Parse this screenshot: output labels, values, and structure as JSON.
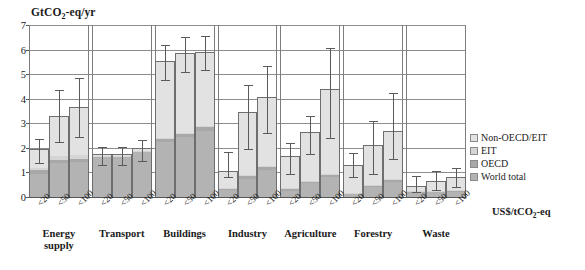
{
  "chart_data": {
    "type": "bar",
    "title": "",
    "ylabel": "GtCO2-eq/yr",
    "ylabel_html": "GtCO<sub>2</sub>-eq/yr",
    "xlabel": "US$/tCO2-eq",
    "xlabel_html": "US$/tCO<sub>2</sub>-eq",
    "ylim": [
      0,
      7
    ],
    "yticks": [
      0,
      1,
      2,
      3,
      4,
      5,
      6,
      7
    ],
    "grid": true,
    "stacked": true,
    "legend_position": "right",
    "legend": [
      {
        "name": "Non-OECD/EIT",
        "color": "#e2e2e2"
      },
      {
        "name": "EIT",
        "color": "#d5d5d5"
      },
      {
        "name": "OECD",
        "color": "#a8a8a8"
      },
      {
        "name": "World total",
        "color": "#b3b3b3"
      }
    ],
    "series": [
      {
        "name": "World total",
        "color": "#b3b3b3"
      },
      {
        "name": "OECD",
        "color": "#a8a8a8"
      },
      {
        "name": "EIT",
        "color": "#d5d5d5"
      },
      {
        "name": "Non-OECD/EIT",
        "color": "#e2e2e2"
      }
    ],
    "categories": [
      "<20",
      "<50",
      "<100"
    ],
    "groups": [
      {
        "label": "Energy supply",
        "label_lines": [
          "Energy",
          "supply"
        ],
        "bars": [
          {
            "category": "<20",
            "world_total": 0.95,
            "oecd": 0.15,
            "eit": 0.1,
            "non_oecd_eit": 0.75,
            "total": 1.95,
            "err_low": 1.4,
            "err_high": 2.35
          },
          {
            "category": "<50",
            "world_total": 1.4,
            "oecd": 0.12,
            "eit": 0.15,
            "non_oecd_eit": 1.63,
            "total": 3.3,
            "err_low": 2.25,
            "err_high": 4.35
          },
          {
            "category": "<100",
            "world_total": 1.42,
            "oecd": 0.13,
            "eit": 0.15,
            "non_oecd_eit": 1.95,
            "total": 3.65,
            "err_low": 2.45,
            "err_high": 4.85
          }
        ]
      },
      {
        "label": "Transport",
        "label_lines": [
          "Transport"
        ],
        "bars": [
          {
            "category": "<20",
            "world_total": 1.62,
            "oecd": 0.04,
            "eit": 0.02,
            "non_oecd_eit": 0.07,
            "total": 1.75,
            "err_low": 1.3,
            "err_high": 2.05
          },
          {
            "category": "<50",
            "world_total": 1.62,
            "oecd": 0.04,
            "eit": 0.02,
            "non_oecd_eit": 0.07,
            "total": 1.75,
            "err_low": 1.3,
            "err_high": 2.05
          },
          {
            "category": "<100",
            "world_total": 1.82,
            "oecd": 0.05,
            "eit": 0.02,
            "non_oecd_eit": 0.11,
            "total": 2.0,
            "err_low": 1.45,
            "err_high": 2.3
          }
        ]
      },
      {
        "label": "Buildings",
        "label_lines": [
          "Buildings"
        ],
        "bars": [
          {
            "category": "<20",
            "world_total": 2.25,
            "oecd": 0.12,
            "eit": 0.05,
            "non_oecd_eit": 3.13,
            "total": 5.55,
            "err_low": 4.75,
            "err_high": 6.2
          },
          {
            "category": "<50",
            "world_total": 2.45,
            "oecd": 0.12,
            "eit": 0.05,
            "non_oecd_eit": 3.23,
            "total": 5.85,
            "err_low": 5.1,
            "err_high": 6.5
          },
          {
            "category": "<100",
            "world_total": 2.7,
            "oecd": 0.15,
            "eit": 0.05,
            "non_oecd_eit": 3.0,
            "total": 5.9,
            "err_low": 5.15,
            "err_high": 6.55
          }
        ]
      },
      {
        "label": "Industry",
        "label_lines": [
          "Industry"
        ],
        "bars": [
          {
            "category": "<20",
            "world_total": 0.28,
            "oecd": 0.07,
            "eit": 0.03,
            "non_oecd_eit": 0.67,
            "total": 1.05,
            "err_low": 0.8,
            "err_high": 1.85
          },
          {
            "category": "<50",
            "world_total": 0.75,
            "oecd": 0.1,
            "eit": 0.05,
            "non_oecd_eit": 2.55,
            "total": 3.45,
            "err_low": 1.95,
            "err_high": 4.55
          },
          {
            "category": "<100",
            "world_total": 1.1,
            "oecd": 0.12,
            "eit": 0.05,
            "non_oecd_eit": 2.78,
            "total": 4.05,
            "err_low": 2.6,
            "err_high": 5.35
          }
        ]
      },
      {
        "label": "Agriculture",
        "label_lines": [
          "Agriculture"
        ],
        "bars": [
          {
            "category": "<20",
            "world_total": 0.25,
            "oecd": 0.06,
            "eit": 0.04,
            "non_oecd_eit": 1.3,
            "total": 1.65,
            "err_low": 0.95,
            "err_high": 2.2
          },
          {
            "category": "<50",
            "world_total": 0.55,
            "oecd": 0.08,
            "eit": 0.04,
            "non_oecd_eit": 1.98,
            "total": 2.65,
            "err_low": 1.75,
            "err_high": 3.3
          },
          {
            "category": "<100",
            "world_total": 0.8,
            "oecd": 0.1,
            "eit": 0.05,
            "non_oecd_eit": 3.45,
            "total": 4.4,
            "err_low": 2.4,
            "err_high": 6.05
          }
        ]
      },
      {
        "label": "Forestry",
        "label_lines": [
          "Forestry"
        ],
        "bars": [
          {
            "category": "<20",
            "world_total": 0.12,
            "oecd": 0.04,
            "eit": 0.02,
            "non_oecd_eit": 1.12,
            "total": 1.3,
            "err_low": 0.8,
            "err_high": 1.8
          },
          {
            "category": "<50",
            "world_total": 0.42,
            "oecd": 0.06,
            "eit": 0.02,
            "non_oecd_eit": 1.6,
            "total": 2.1,
            "err_low": 0.95,
            "err_high": 3.1
          },
          {
            "category": "<100",
            "world_total": 0.62,
            "oecd": 0.08,
            "eit": 0.03,
            "non_oecd_eit": 1.97,
            "total": 2.7,
            "err_low": 1.55,
            "err_high": 4.25
          }
        ]
      },
      {
        "label": "Waste",
        "label_lines": [
          "Waste"
        ],
        "bars": [
          {
            "category": "<20",
            "world_total": 0.18,
            "oecd": 0.04,
            "eit": 0.02,
            "non_oecd_eit": 0.21,
            "total": 0.45,
            "err_low": 0.22,
            "err_high": 0.85
          },
          {
            "category": "<50",
            "world_total": 0.2,
            "oecd": 0.04,
            "eit": 0.02,
            "non_oecd_eit": 0.39,
            "total": 0.65,
            "err_low": 0.3,
            "err_high": 1.05
          },
          {
            "category": "<100",
            "world_total": 0.22,
            "oecd": 0.05,
            "eit": 0.02,
            "non_oecd_eit": 0.51,
            "total": 0.8,
            "err_low": 0.4,
            "err_high": 1.2
          }
        ]
      }
    ]
  }
}
